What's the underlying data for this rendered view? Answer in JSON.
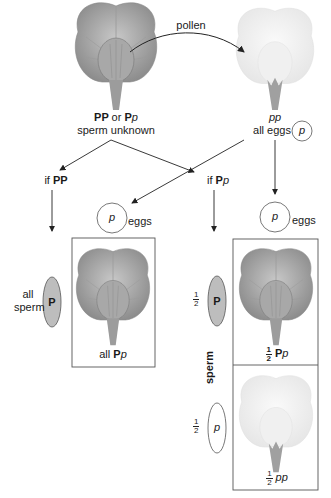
{
  "figure": {
    "pollen_label": "pollen",
    "parent_left": {
      "genotype_a": "PP",
      "or": "or",
      "genotype_b_upper": "P",
      "genotype_b_lower": "p",
      "subtitle": "sperm unknown",
      "flower_color": "purple (dark gray)"
    },
    "parent_right": {
      "genotype": "pp",
      "subtitle": "all eggs",
      "egg_allele": "p",
      "flower_color": "white"
    },
    "branch_left": {
      "label_prefix": "if",
      "label_genotype": "PP",
      "egg_allele": "p",
      "egg_label": "eggs",
      "sperm_prefix": "all",
      "sperm_label": "sperm",
      "sperm_allele": "P",
      "offspring_prefix": "all",
      "offspring_upper": "P",
      "offspring_lower": "p"
    },
    "branch_right": {
      "label_prefix": "if",
      "label_upper": "P",
      "label_lower": "p",
      "egg_allele": "p",
      "egg_label": "eggs",
      "sperm_label": "sperm",
      "fraction_num": "1",
      "fraction_den": "2",
      "sperm_allele_1": "P",
      "sperm_allele_2": "p",
      "offspring_1_upper": "P",
      "offspring_1_lower": "p",
      "offspring_2": "pp"
    },
    "colors": {
      "purple_flower": "#8a8a8a",
      "white_flower": "#eeeeee",
      "sperm_P_fill": "#bdbdbd",
      "line": "#222222"
    }
  }
}
